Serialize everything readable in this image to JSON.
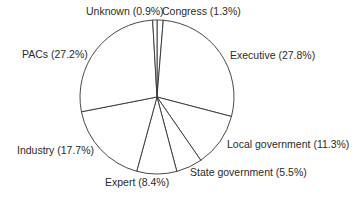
{
  "chart_data": {
    "type": "pie",
    "title": "",
    "start_angle_deg": 0,
    "direction": "clockwise",
    "categories": [
      "Congress",
      "Executive",
      "Local government",
      "State government",
      "Expert",
      "Industry",
      "PACs",
      "Unknown"
    ],
    "values": [
      1.3,
      27.8,
      11.3,
      5.5,
      8.4,
      17.7,
      27.2,
      0.9
    ],
    "unit": "%",
    "labels": [
      "Congress (1.3%)",
      "Executive (27.8%)",
      "Local government (11.3%)",
      "State government (5.5%)",
      "Expert (8.4%)",
      "Industry (17.7%)",
      "PACs (27.2%)",
      "Unknown (0.9%)"
    ],
    "colors": {
      "fill": "#ffffff",
      "stroke": "#333333"
    },
    "legend": "none (labels placed outside slices)"
  }
}
